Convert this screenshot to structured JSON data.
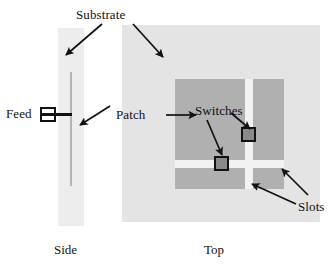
{
  "figure": {
    "width": 334,
    "height": 273,
    "background": "#ffffff"
  },
  "labels": {
    "substrate": "Substrate",
    "feed": "Feed",
    "patch": "Patch",
    "switches": "Switches",
    "slots": "Slots"
  },
  "captions": {
    "side": "Side",
    "top": "Top"
  },
  "colors": {
    "substrate_side": "#ededed",
    "substrate_top": "#e4e4e4",
    "patch_side": "#b4b4b4",
    "patch_top": "#b0b0b0",
    "slot": "#f2f2f2",
    "switch_fill": "#8a8a8a",
    "stroke": "#111111",
    "background": "#ffffff"
  },
  "side_view": {
    "substrate": {
      "x": 58,
      "y": 28,
      "width": 26,
      "height": 198
    },
    "patch": {
      "x": 70,
      "y": 72,
      "width": 2,
      "height": 114
    },
    "feed_box": {
      "x": 40,
      "y": 107,
      "width": 16,
      "height": 15
    },
    "feed_line": {
      "x": 54,
      "y": 113,
      "width": 18,
      "height": 3
    }
  },
  "top_view": {
    "substrate": {
      "x": 122,
      "y": 25,
      "width": 198,
      "height": 197
    },
    "patch": {
      "x": 175,
      "y": 79,
      "width": 109,
      "height": 110
    },
    "slot_horizontal": {
      "x": 175,
      "y": 160,
      "width": 109,
      "height": 8
    },
    "slot_vertical": {
      "x": 245,
      "y": 79,
      "width": 8,
      "height": 110
    },
    "switches": [
      {
        "name": "switch-on-vertical-slot",
        "x": 241,
        "y": 127,
        "size": 15
      },
      {
        "name": "switch-on-horizontal-slot",
        "x": 214,
        "y": 156,
        "size": 15
      }
    ]
  },
  "annotations": [
    {
      "name": "substrate-to-side",
      "from": [
        102,
        24
      ],
      "to": [
        65,
        55
      ]
    },
    {
      "name": "substrate-to-top",
      "from": [
        133,
        24
      ],
      "to": [
        163,
        57
      ]
    },
    {
      "name": "patch-to-side",
      "from": [
        110,
        106
      ],
      "to": [
        80,
        125
      ]
    },
    {
      "name": "patch-to-top",
      "from": [
        168,
        115
      ],
      "to": [
        196,
        115
      ]
    },
    {
      "name": "switches-to-vertical",
      "from": [
        231,
        113
      ],
      "to": [
        253,
        131
      ]
    },
    {
      "name": "switches-to-horizontal",
      "from": [
        207,
        120
      ],
      "to": [
        224,
        158
      ]
    },
    {
      "name": "slots-to-vertical",
      "from": [
        295,
        205
      ],
      "to": [
        251,
        185
      ]
    },
    {
      "name": "slots-to-horizontal",
      "from": [
        307,
        196
      ],
      "to": [
        281,
        170
      ]
    }
  ],
  "label_positions": {
    "substrate": {
      "x": 76,
      "y": 8
    },
    "feed": {
      "x": 6,
      "y": 107
    },
    "patch": {
      "x": 116,
      "y": 108
    },
    "switches": {
      "x": 195,
      "y": 104
    },
    "slots": {
      "x": 296,
      "y": 206
    },
    "side_caption": {
      "x": 54,
      "y": 243
    },
    "top_caption": {
      "x": 204,
      "y": 243
    }
  }
}
